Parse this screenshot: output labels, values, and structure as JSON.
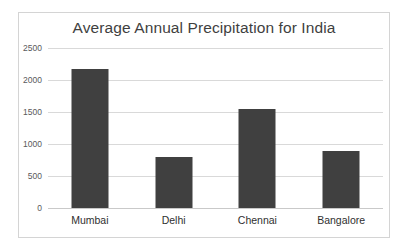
{
  "chart_data": {
    "type": "bar",
    "title": "Average Annual Precipitation for India",
    "xlabel": "",
    "ylabel": "",
    "categories": [
      "Mumbai",
      "Delhi",
      "Chennai",
      "Bangalore"
    ],
    "values": [
      2165,
      790,
      1540,
      890
    ],
    "ylim": [
      0,
      2500
    ],
    "yticks": [
      0,
      500,
      1000,
      1500,
      2000,
      2500
    ],
    "ytick_labels": [
      "0",
      "500",
      "1000",
      "1500",
      "2000",
      "2500"
    ],
    "grid": true,
    "legend": false,
    "bar_color": "#404040",
    "gridline_color": "#d9d9d9",
    "border_color": "#d4d4d4",
    "background_color": "#ffffff",
    "title_color": "#3f3f3f",
    "tick_label_color": "#59595b",
    "category_label_color": "#2f2f2f"
  }
}
